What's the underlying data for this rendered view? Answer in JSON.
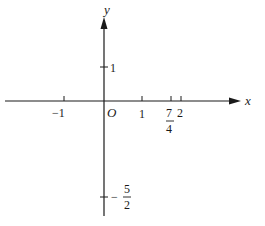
{
  "diagram": {
    "type": "coordinate-axes",
    "axes": {
      "x_label": "x",
      "y_label": "y",
      "origin_label": "O"
    },
    "x_ticks": [
      {
        "value": -1,
        "label": "−1",
        "px": 64
      },
      {
        "value": 1,
        "label": "1",
        "px": 142
      },
      {
        "value": 1.75,
        "label_num": "7",
        "label_den": "4",
        "px": 171
      },
      {
        "value": 2,
        "label": "2",
        "px": 181
      }
    ],
    "y_ticks": [
      {
        "value": 1,
        "label": "1",
        "py": 67
      },
      {
        "value": -2.5,
        "label_sign": "−",
        "label_num": "5",
        "label_den": "2",
        "py": 197
      }
    ],
    "colors": {
      "axis": "#1a1a1a",
      "background": "#ffffff"
    }
  }
}
